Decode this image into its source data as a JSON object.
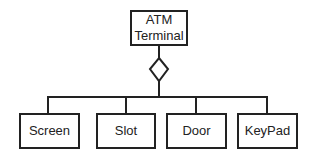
{
  "diagram": {
    "type": "UML aggregation",
    "whole": {
      "line1": "ATM",
      "line2": "Terminal"
    },
    "parts": [
      {
        "label": "Screen"
      },
      {
        "label": "Slot"
      },
      {
        "label": "Door"
      },
      {
        "label": "KeyPad"
      }
    ],
    "relationship": "aggregation-diamond",
    "colors": {
      "stroke": "#222222",
      "background": "#ffffff"
    }
  }
}
